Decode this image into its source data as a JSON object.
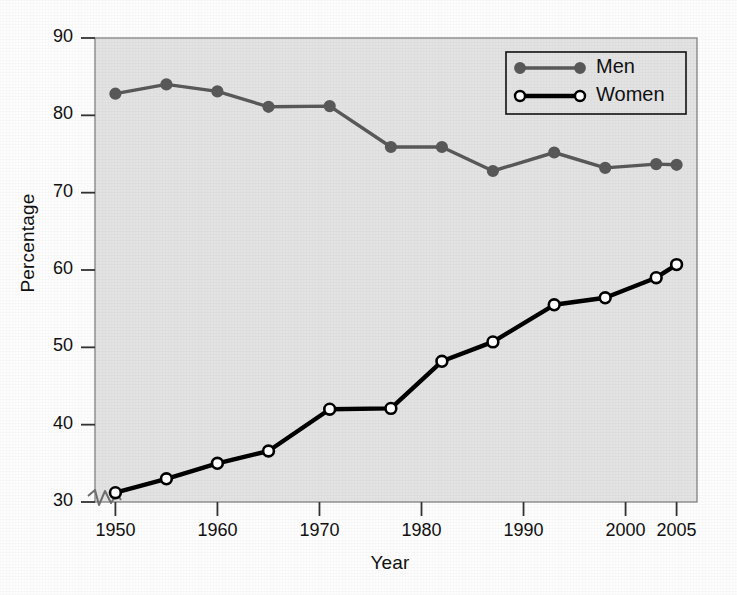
{
  "chart_data": {
    "type": "line",
    "title": "",
    "xlabel": "Year",
    "ylabel": "Percentage",
    "xlim": [
      1948,
      2007
    ],
    "ylim": [
      30,
      90
    ],
    "xticks": [
      1950,
      1960,
      1970,
      1980,
      1990,
      2000,
      2005
    ],
    "yticks": [
      30,
      40,
      50,
      60,
      70,
      80,
      90
    ],
    "grid": false,
    "y_axis_break": true,
    "legend_position": "top-right",
    "plot_background": "#e3e3e3",
    "series": [
      {
        "name": "Men",
        "color": "#595959",
        "marker": "filled-circle",
        "marker_face": "#595959",
        "x": [
          1950,
          1955,
          1960,
          1965,
          1971,
          1977,
          1982,
          1987,
          1993,
          1998,
          2003,
          2005
        ],
        "values": [
          82.8,
          84.0,
          83.1,
          81.1,
          81.2,
          75.9,
          75.9,
          72.8,
          75.2,
          73.2,
          73.7,
          73.6
        ]
      },
      {
        "name": "Women",
        "color": "#000000",
        "marker": "open-circle",
        "marker_face": "#ffffff",
        "x": [
          1950,
          1955,
          1960,
          1965,
          1971,
          1977,
          1982,
          1987,
          1993,
          1998,
          2003,
          2005
        ],
        "values": [
          31.2,
          33.0,
          35.0,
          36.6,
          42.0,
          42.1,
          48.2,
          50.7,
          55.5,
          56.4,
          59.0,
          60.7
        ]
      }
    ]
  },
  "legend": {
    "entries": [
      {
        "label": "Men"
      },
      {
        "label": "Women"
      }
    ]
  }
}
